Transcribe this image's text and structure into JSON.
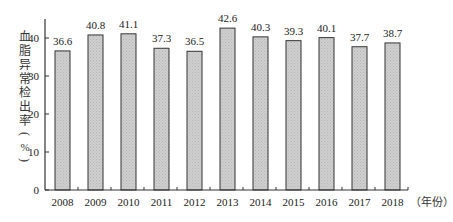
{
  "chart_data": {
    "type": "bar",
    "title": "",
    "xlabel": "（年份）",
    "ylabel": "血脂异常检出率（%）",
    "ylabel_chars": [
      "血",
      "脂",
      "异",
      "常",
      "检",
      "出",
      "率"
    ],
    "ylabel_unit": "%",
    "categories": [
      "2008",
      "2009",
      "2010",
      "2011",
      "2012",
      "2013",
      "2014",
      "2015",
      "2016",
      "2017",
      "2018"
    ],
    "values": [
      36.6,
      40.8,
      41.1,
      37.3,
      36.5,
      42.6,
      40.3,
      39.3,
      40.1,
      37.7,
      38.7
    ],
    "data_labels": [
      "36.6",
      "40.8",
      "41.1",
      "37.3",
      "36.5",
      "42.6",
      "40.3",
      "39.3",
      "40.1",
      "37.7",
      "38.7"
    ],
    "yticks": [
      0,
      10,
      20,
      30,
      40
    ],
    "ylim": [
      0,
      45
    ],
    "grid": false,
    "legend": null,
    "bar_fill": "#c8c8c8",
    "bar_stroke": "#333333"
  }
}
